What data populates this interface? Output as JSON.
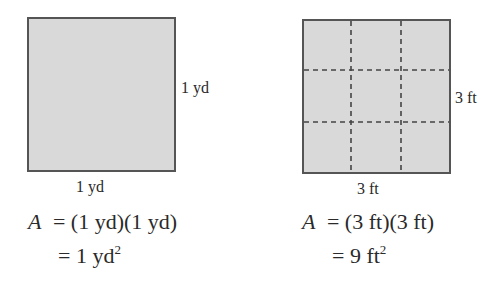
{
  "left": {
    "side_label": "1 yd",
    "bottom_label": "1 yd",
    "eq_var": "A",
    "eq_line1_rhs": "= (1 yd)(1 yd)",
    "eq_line2_prefix": "= 1 yd",
    "eq_line2_exp": "2"
  },
  "right": {
    "side_label": "3 ft",
    "bottom_label": "3 ft",
    "eq_var": "A",
    "eq_line1_rhs": "= (3 ft)(3 ft)",
    "eq_line2_prefix": "= 9 ft",
    "eq_line2_exp": "2",
    "grid_divisions": 3
  },
  "colors": {
    "fill": "#d9d9d9",
    "border": "#555555",
    "dash": "#444444"
  }
}
